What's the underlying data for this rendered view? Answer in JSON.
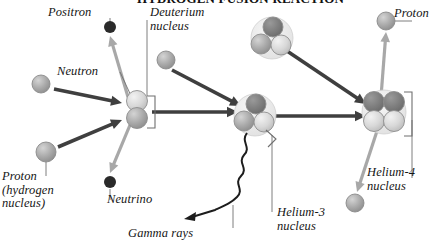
{
  "figure": {
    "title": "HYDROGEN FUSION REACTION",
    "title_clipped": true,
    "type": "proton-proton-chain-diagram",
    "background_color": "#ffffff"
  },
  "colors": {
    "arrow_dark": "#3f3f3f",
    "arrow_light": "#a8a8a8",
    "particle_light": "#c9c9c9",
    "particle_mid": "#9c9c9c",
    "particle_dark": "#2a2a2a",
    "nucleus_halo": "#e4e4e4",
    "leader_line": "#6f6f6f",
    "text": "#151515"
  },
  "labels": [
    {
      "id": "positron",
      "text": "Positron",
      "x": 48,
      "y": 6,
      "lines": [
        "Positron"
      ]
    },
    {
      "id": "deuterium",
      "text": "Deuterium nucleus",
      "x": 150,
      "y": 6,
      "lines": [
        "Deuterium",
        "nucleus"
      ]
    },
    {
      "id": "proton-top-right",
      "text": "Proton",
      "x": 394,
      "y": 7,
      "lines": [
        "Proton"
      ]
    },
    {
      "id": "neutron",
      "text": "Neutron",
      "x": 57,
      "y": 65,
      "lines": [
        "Neutron"
      ]
    },
    {
      "id": "proton-hydrogen",
      "text": "Proton (hydrogen nucleus)",
      "x": 2,
      "y": 170,
      "lines": [
        "Proton",
        "(hydrogen",
        "nucleus)"
      ]
    },
    {
      "id": "neutrino",
      "text": "Neutrino",
      "x": 107,
      "y": 193,
      "lines": [
        "Neutrino"
      ]
    },
    {
      "id": "gamma-rays",
      "text": "Gamma rays",
      "x": 128,
      "y": 227,
      "lines": [
        "Gamma rays"
      ]
    },
    {
      "id": "helium-3",
      "text": "Helium-3 nucleus",
      "x": 277,
      "y": 206,
      "lines": [
        "Helium-3",
        "nucleus"
      ]
    },
    {
      "id": "helium-4",
      "text": "Helium-4 nucleus",
      "x": 367,
      "y": 166,
      "lines": [
        "Helium-4",
        "nucleus"
      ]
    }
  ],
  "particles": [
    {
      "id": "positron-dot",
      "name": "positron",
      "x": 110,
      "y": 27,
      "r": 6,
      "fill": "particle_dark"
    },
    {
      "id": "proton-upper-left",
      "name": "proton",
      "x": 41,
      "y": 84,
      "r": 9,
      "fill": "particle_mid"
    },
    {
      "id": "proton-lower-left",
      "name": "proton",
      "x": 46,
      "y": 152,
      "r": 10,
      "fill": "particle_mid"
    },
    {
      "id": "proton-deuterium-feed",
      "name": "proton",
      "x": 166,
      "y": 60,
      "r": 9,
      "fill": "particle_mid"
    },
    {
      "id": "neutrino-dot",
      "name": "neutrino",
      "x": 110,
      "y": 182,
      "r": 6,
      "fill": "particle_dark"
    },
    {
      "id": "proton-emitted",
      "name": "proton",
      "x": 386,
      "y": 21,
      "r": 9,
      "fill": "particle_mid"
    },
    {
      "id": "proton-released",
      "name": "proton",
      "x": 355,
      "y": 203,
      "r": 9,
      "fill": "particle_mid"
    }
  ],
  "nuclei": [
    {
      "id": "deuterium-nucleus",
      "name": "deuterium-nucleus",
      "x": 137,
      "y": 110,
      "nucleon_count": 2
    },
    {
      "id": "helium3-upper",
      "name": "helium-3-nucleus",
      "x": 272,
      "y": 38,
      "nucleon_count": 3
    },
    {
      "id": "helium3-lower",
      "name": "helium-3-nucleus",
      "x": 255,
      "y": 115,
      "nucleon_count": 3
    },
    {
      "id": "helium4-nucleus",
      "name": "helium-4-nucleus",
      "x": 384,
      "y": 112,
      "nucleon_count": 4
    }
  ],
  "arrows": [
    {
      "id": "proton-ul-to-deuterium",
      "style": "dark",
      "from": [
        54,
        89
      ],
      "to": [
        122,
        103
      ]
    },
    {
      "id": "proton-ll-to-deuterium",
      "style": "dark",
      "from": [
        58,
        147
      ],
      "to": [
        122,
        120
      ]
    },
    {
      "id": "deuterium-to-positron",
      "style": "light",
      "from": [
        128,
        97
      ],
      "to": [
        110,
        36
      ]
    },
    {
      "id": "deuterium-to-neutrino",
      "style": "light",
      "from": [
        130,
        125
      ],
      "to": [
        110,
        173
      ]
    },
    {
      "id": "proton-to-helium3",
      "style": "dark",
      "from": [
        172,
        70
      ],
      "to": [
        241,
        106
      ]
    },
    {
      "id": "deuterium-to-helium3",
      "style": "dark",
      "from": [
        152,
        112
      ],
      "to": [
        238,
        112
      ]
    },
    {
      "id": "helium3-upper-to-he4",
      "style": "dark",
      "from": [
        287,
        51
      ],
      "to": [
        366,
        104
      ]
    },
    {
      "id": "helium3-lower-to-he4",
      "style": "dark",
      "from": [
        271,
        116
      ],
      "to": [
        366,
        116
      ]
    },
    {
      "id": "he4-to-proton-emitted",
      "style": "light",
      "from": [
        381,
        97
      ],
      "to": [
        386,
        32
      ]
    },
    {
      "id": "he4-to-proton-released",
      "style": "light",
      "from": [
        378,
        128
      ],
      "to": [
        357,
        192
      ]
    }
  ],
  "gamma_wave": {
    "id": "gamma-rays-wave",
    "name": "gamma-rays-wave",
    "description": "wavy arrow emitted downward-left from Helium-3 nucleus",
    "start": [
      247,
      133
    ],
    "end": [
      184,
      219
    ]
  },
  "leaders": [
    {
      "id": "leader-positron",
      "from": [
        110,
        18
      ],
      "to": [
        110,
        22
      ]
    },
    {
      "id": "leader-deuterium",
      "from": [
        147,
        20
      ],
      "to": [
        147,
        96
      ]
    },
    {
      "id": "leader-neutron",
      "from": [
        120,
        72
      ],
      "to": [
        133,
        100
      ]
    },
    {
      "id": "leader-proton-hydrogen",
      "from": [
        46,
        162
      ],
      "to": [
        46,
        176
      ]
    },
    {
      "id": "leader-neutrino",
      "from": [
        110,
        189
      ],
      "to": [
        110,
        200
      ]
    },
    {
      "id": "leader-proton-tr",
      "from": [
        395,
        21
      ],
      "to": [
        412,
        21
      ]
    },
    {
      "id": "leader-helium3",
      "from": [
        272,
        135
      ],
      "to": [
        272,
        212
      ]
    },
    {
      "id": "leader-helium4",
      "from": [
        412,
        120
      ],
      "to": [
        412,
        178
      ]
    },
    {
      "id": "leader-gamma",
      "from": [
        233,
        205
      ],
      "to": [
        233,
        228
      ]
    }
  ]
}
